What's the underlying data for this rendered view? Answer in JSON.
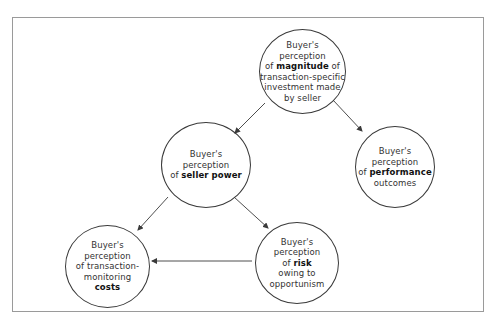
{
  "colors": {
    "stroke": "#3a3a3a",
    "frame": "#9a9a9a",
    "text": "#333333",
    "background": "#ffffff"
  },
  "nodes": {
    "magnitude": {
      "line1": "Buyer's",
      "line2": "perception",
      "line3_pre": "of ",
      "line3_bold": "magnitude",
      "line3_post": " of",
      "line4": "transaction-specific",
      "line5": "investment made",
      "line6": "by seller"
    },
    "seller_power": {
      "line1": "Buyer's",
      "line2": "perception",
      "line3_pre": "of ",
      "line3_bold": "seller power"
    },
    "performance": {
      "line1": "Buyer's",
      "line2": "perception",
      "line3_pre": "of ",
      "line3_bold": "performance",
      "line4": "outcomes"
    },
    "costs": {
      "line1": "Buyer's",
      "line2": "perception",
      "line3": "of transaction-",
      "line4": "monitoring",
      "line5_bold": "costs"
    },
    "risk": {
      "line1": "Buyer's",
      "line2": "perception",
      "line3_pre": "of ",
      "line3_bold": "risk",
      "line4": "owing to",
      "line5": "opportunism"
    }
  },
  "edges": [
    {
      "from": "magnitude",
      "to": "seller_power"
    },
    {
      "from": "magnitude",
      "to": "performance"
    },
    {
      "from": "seller_power",
      "to": "costs"
    },
    {
      "from": "seller_power",
      "to": "risk"
    },
    {
      "from": "risk",
      "to": "costs"
    }
  ]
}
